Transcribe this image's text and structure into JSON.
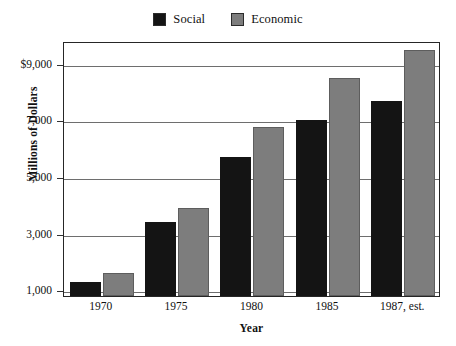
{
  "chart_data": {
    "type": "bar",
    "title": "",
    "xlabel": "Year",
    "ylabel": "Millions of Dollars",
    "categories": [
      "1970",
      "1975",
      "1980",
      "1985",
      "1987, est."
    ],
    "series": [
      {
        "name": "Social",
        "color": "#141414",
        "values": [
          1300,
          3400,
          5700,
          7000,
          7700
        ]
      },
      {
        "name": "Economic",
        "color": "#7d7d7d",
        "values": [
          1600,
          3900,
          6750,
          8500,
          9500
        ]
      }
    ],
    "ylim": [
      800,
      9800
    ],
    "yticks": [
      1000,
      3000,
      5000,
      7000,
      9000
    ],
    "yticklabels": [
      "1,000",
      "3,000",
      "5,000",
      "7,000",
      "$9,000"
    ],
    "grid": true,
    "legend_position": "top-center"
  },
  "legend": {
    "entries": [
      {
        "label": "Social",
        "swatch": "black-square-swatch"
      },
      {
        "label": "Economic",
        "swatch": "gray-square-swatch"
      }
    ]
  },
  "axes": {
    "y_title": "Millions of Dollars",
    "x_title": "Year"
  }
}
